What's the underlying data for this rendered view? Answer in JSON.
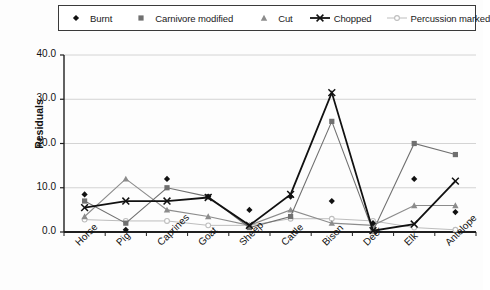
{
  "legend": {
    "items": [
      {
        "label": "Burnt",
        "marker": "diamond-marker-icon",
        "color": "#111111",
        "line": false
      },
      {
        "label": "Carnivore modified",
        "marker": "square-marker-icon",
        "color": "#707070",
        "line": false
      },
      {
        "label": "Cut",
        "marker": "triangle-marker-icon",
        "color": "#8c8c8c",
        "line": false
      },
      {
        "label": "Chopped",
        "marker": "x-marker-icon",
        "color": "#111111",
        "line": true
      },
      {
        "label": "Percussion marked",
        "marker": "circle-marker-icon",
        "color": "#bdbdbd",
        "line": true
      }
    ]
  },
  "axes": {
    "ylabel": "Residuals",
    "yticks": [
      "0.0",
      "10.0",
      "20.0",
      "30.0",
      "40.0"
    ],
    "ymin": 0,
    "ymax": 40
  },
  "chart_data": {
    "type": "line",
    "title": "",
    "xlabel": "",
    "ylabel": "Residuals",
    "ylim": [
      0,
      40
    ],
    "grid": true,
    "legend_position": "top",
    "categories": [
      "Horse",
      "Pig",
      "Caprines",
      "Goat",
      "Sheep",
      "Cattle",
      "Bison",
      "Deer",
      "Elk",
      "Antelope"
    ],
    "series": [
      {
        "name": "Burnt",
        "marker": "diamond",
        "color": "#111111",
        "line": false,
        "values": [
          8.5,
          0.5,
          12.0,
          8.0,
          5.0,
          8.0,
          7.0,
          2.0,
          12.0,
          4.5
        ]
      },
      {
        "name": "Carnivore modified",
        "marker": "square",
        "color": "#707070",
        "line": true,
        "values": [
          7.0,
          2.0,
          10.0,
          8.0,
          1.0,
          3.5,
          25.0,
          0.2,
          20.0,
          17.5
        ]
      },
      {
        "name": "Cut",
        "marker": "triangle",
        "color": "#8c8c8c",
        "line": true,
        "values": [
          3.5,
          12.0,
          5.0,
          3.5,
          1.5,
          5.0,
          2.0,
          1.5,
          6.0,
          6.0
        ]
      },
      {
        "name": "Chopped",
        "marker": "x",
        "color": "#111111",
        "line": true,
        "values": [
          5.5,
          7.0,
          7.0,
          7.8,
          1.5,
          8.5,
          31.5,
          0.3,
          1.8,
          11.5
        ]
      },
      {
        "name": "Percussion marked",
        "marker": "circle",
        "color": "#bdbdbd",
        "line": true,
        "values": [
          2.8,
          2.5,
          2.5,
          1.5,
          1.5,
          3.0,
          3.0,
          2.5,
          1.0,
          0.5
        ]
      }
    ]
  }
}
